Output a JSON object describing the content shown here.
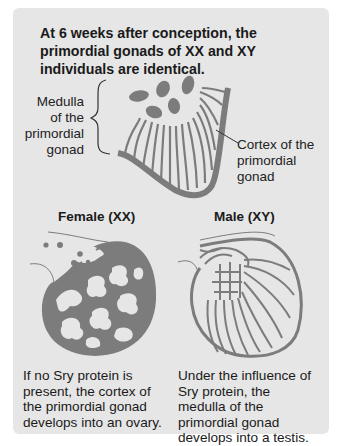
{
  "title": "At 6 weeks after conception, the primordial gonads of XX and XY individuals are identical.",
  "labels": {
    "medulla": "Medulla of the primordial gonad",
    "cortex": "Cortex of the primordial gonad"
  },
  "female": {
    "heading": "Female (XX)",
    "description": "If no Sry protein is present, the cortex of the primordial gonad develops into an ovary."
  },
  "male": {
    "heading": "Male (XY)",
    "description": "Under the influence of Sry protein, the medulla of the primordial gonad develops into a testis."
  },
  "colors": {
    "panel": "#e6e6e6",
    "tissue": "#7c7c7c",
    "text": "#1a1a1a"
  }
}
